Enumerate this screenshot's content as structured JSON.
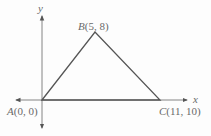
{
  "diagram": {
    "type": "coordinate-triangle",
    "axes": {
      "x_label": "x",
      "y_label": "y"
    },
    "points": [
      {
        "name": "A",
        "coords": "(0, 0)",
        "label": "A(0, 0)"
      },
      {
        "name": "B",
        "coords": "(5, 8)",
        "label": "B(5, 8)"
      },
      {
        "name": "C",
        "coords": "(11, 10)",
        "label": "C(11, 10)"
      }
    ],
    "colors": {
      "lines": "#555555",
      "labels": "#6a6a6a"
    }
  }
}
